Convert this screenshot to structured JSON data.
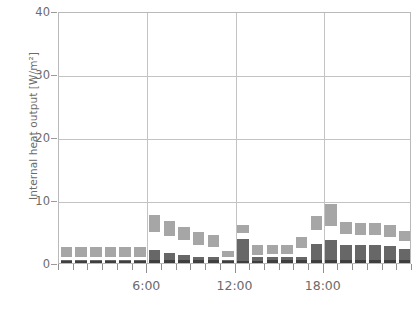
{
  "chart_data": {
    "type": "bar",
    "stacked": true,
    "title": "",
    "xlabel": "",
    "ylabel": "Internal heat output [W/m²]",
    "ylim": [
      0,
      40
    ],
    "ytick_labels": [
      "0",
      "10",
      "20",
      "30",
      "40"
    ],
    "ytick_values": [
      0,
      10,
      20,
      30,
      40
    ],
    "grid": true,
    "grid_axis": "both",
    "legend": "none",
    "xlim": [
      0,
      24
    ],
    "xtick_labels": [
      "6:00",
      "12:00",
      "18:00"
    ],
    "xtick_values": [
      6,
      12,
      18
    ],
    "x_unit": "hour",
    "categories": [
      "0:00",
      "1:00",
      "2:00",
      "3:00",
      "4:00",
      "5:00",
      "6:00",
      "7:00",
      "8:00",
      "9:00",
      "10:00",
      "11:00",
      "12:00",
      "13:00",
      "14:00",
      "15:00",
      "16:00",
      "17:00",
      "18:00",
      "19:00",
      "20:00",
      "21:00",
      "22:00",
      "23:00"
    ],
    "series": [
      {
        "name": "base-load",
        "color": "#3f3f3f",
        "values": [
          0.3,
          0.3,
          0.3,
          0.3,
          0.3,
          0.3,
          0.4,
          0.4,
          0.4,
          0.4,
          0.4,
          0.3,
          0.3,
          0.3,
          0.4,
          0.4,
          0.4,
          0.4,
          0.5,
          0.5,
          0.5,
          0.5,
          0.5,
          0.5
        ]
      },
      {
        "name": "occupants",
        "color": "#676767",
        "values": [
          0.2,
          0.2,
          0.2,
          0.2,
          0.2,
          0.2,
          1.7,
          1.2,
          0.9,
          0.6,
          0.5,
          0.2,
          3.5,
          0.6,
          0.6,
          0.6,
          0.6,
          2.6,
          3.1,
          2.4,
          2.3,
          2.3,
          2.2,
          1.8
        ]
      },
      {
        "name": "lighting",
        "color": "#ffffff",
        "values": [
          0.4,
          0.4,
          0.4,
          0.4,
          0.4,
          0.4,
          2.9,
          2.7,
          2.4,
          1.9,
          1.6,
          0.4,
          0.9,
          0.4,
          0.4,
          0.4,
          1.4,
          2.3,
          2.3,
          1.7,
          1.6,
          1.6,
          1.5,
          1.2
        ]
      },
      {
        "name": "appliances",
        "color": "#a6a6a6",
        "values": [
          1.6,
          1.6,
          1.6,
          1.6,
          1.6,
          1.6,
          2.7,
          2.3,
          2.1,
          2.0,
          1.9,
          1.0,
          1.3,
          1.5,
          1.5,
          1.5,
          1.8,
          2.2,
          3.5,
          1.9,
          1.9,
          1.9,
          1.8,
          1.6
        ]
      }
    ],
    "totals": [
      2.5,
      2.5,
      2.5,
      2.5,
      2.5,
      2.5,
      7.7,
      6.6,
      5.8,
      4.9,
      4.4,
      1.9,
      6.0,
      2.8,
      2.9,
      2.9,
      4.2,
      7.5,
      9.4,
      6.5,
      6.3,
      6.3,
      6.0,
      5.1
    ]
  },
  "style": {
    "axis_color": "#b9b9b9",
    "grid_color": "#c3c3c3",
    "tick_color": "#8f8f8f",
    "text_color": "#6b6b6b",
    "background": "#ffffff"
  }
}
